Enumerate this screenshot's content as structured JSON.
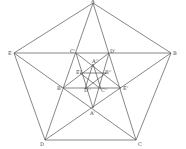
{
  "diagram": {
    "type": "nested-pentagon-pentagram",
    "outer_points": {
      "A": {
        "label": "A",
        "x": 93,
        "y": 3
      },
      "B": {
        "label": "B",
        "x": 171,
        "y": 53
      },
      "C": {
        "label": "C",
        "x": 136,
        "y": 140
      },
      "D": {
        "label": "D",
        "x": 45,
        "y": 140
      },
      "E": {
        "label": "E",
        "x": 14,
        "y": 53
      }
    },
    "middle_points": {
      "A1": {
        "label": "A'",
        "x": 93,
        "y": 108
      },
      "B1": {
        "label": "B'",
        "x": 63,
        "y": 88
      },
      "C1": {
        "label": "C'",
        "x": 76,
        "y": 53
      },
      "D1": {
        "label": "D'",
        "x": 109,
        "y": 53
      },
      "E1": {
        "label": "E'",
        "x": 121,
        "y": 88
      }
    },
    "inner_points": {
      "A2": {
        "label": "A''",
        "x": 93,
        "y": 64
      },
      "B2": {
        "label": "B''",
        "x": 106,
        "y": 73
      },
      "C2": {
        "label": "C''",
        "x": 101,
        "y": 89
      },
      "D2": {
        "label": "D''",
        "x": 85,
        "y": 89
      },
      "E2": {
        "label": "E''",
        "x": 80,
        "y": 73
      }
    }
  }
}
